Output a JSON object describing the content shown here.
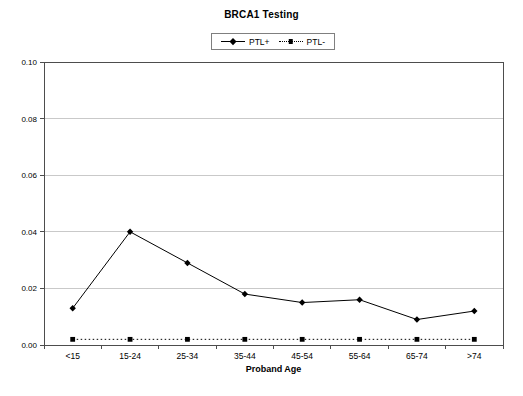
{
  "chart_data": {
    "type": "line",
    "title": "BRCA1 Testing",
    "xlabel": "Proband Age",
    "ylabel": "",
    "categories": [
      "<15",
      "15-24",
      "25-34",
      "35-44",
      "45-54",
      "55-64",
      "65-74",
      ">74"
    ],
    "series": [
      {
        "name": "PTL+",
        "marker": "diamond",
        "line_style": "solid",
        "values": [
          0.013,
          0.04,
          0.029,
          0.018,
          0.015,
          0.016,
          0.009,
          0.012
        ]
      },
      {
        "name": "PTL-",
        "marker": "square",
        "line_style": "dotted",
        "values": [
          0.002,
          0.002,
          0.002,
          0.002,
          0.002,
          0.002,
          0.002,
          0.002
        ]
      }
    ],
    "ylim": [
      0,
      0.1
    ],
    "ytick_step": 0.02,
    "ytick_labels": [
      "0.00",
      "0.02",
      "0.04",
      "0.06",
      "0.08",
      "0.10"
    ],
    "grid": true,
    "legend_position": "top-center",
    "colors": {
      "series": "#000000",
      "gridline": "#c9c9c9",
      "axis": "#4d4d4d",
      "text": "#000000",
      "background": "#ffffff"
    }
  }
}
